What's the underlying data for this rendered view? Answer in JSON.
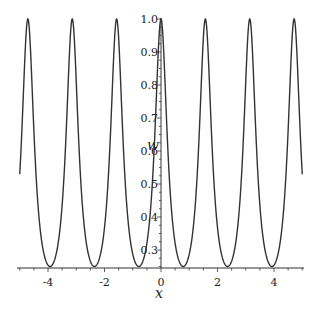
{
  "chart_data": {
    "type": "line",
    "title": "",
    "xlabel": "x",
    "ylabel": "w",
    "xlim": [
      -5,
      5
    ],
    "ylim": [
      0.245,
      1.0
    ],
    "x_ticks": [
      -4,
      -2,
      0,
      2,
      4
    ],
    "y_ticks": [
      0.3,
      0.4,
      0.5,
      0.6,
      0.7,
      0.8,
      0.9,
      1.0
    ],
    "grid": false,
    "legend": null,
    "series": [
      {
        "name": "w(x)",
        "color": "#333333",
        "description": "periodic curve, period pi/2, peaks w=1.0 at x=k*pi/2, minima w~0.25 at x=pi/4+k*pi/2",
        "x": [
          -5.0,
          -4.71,
          -3.93,
          -3.14,
          -2.36,
          -1.57,
          -0.785,
          0.0,
          0.785,
          1.57,
          2.36,
          3.14,
          3.93,
          4.71,
          5.0
        ],
        "y": [
          0.6,
          1.0,
          0.25,
          1.0,
          0.25,
          1.0,
          0.25,
          1.0,
          0.25,
          1.0,
          0.25,
          1.0,
          0.25,
          1.0,
          0.6
        ]
      }
    ]
  }
}
